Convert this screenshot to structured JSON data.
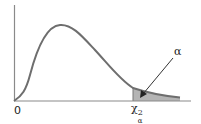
{
  "diagram": {
    "labels": {
      "origin": "0",
      "critical_value": "χ",
      "critical_sup": "2",
      "critical_sub": "α",
      "tail_area": "α"
    },
    "colors": {
      "curve": "#6e6e6e",
      "axis": "#8a8a8a",
      "shaded_tail": "#b4b4b4",
      "arrow": "#333333"
    }
  }
}
